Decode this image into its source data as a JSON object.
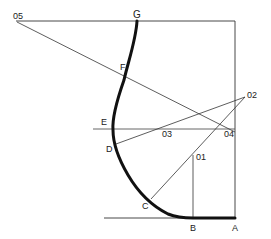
{
  "diagram": {
    "type": "geometric construction of curve",
    "labels": {
      "o5": "05",
      "G": "G",
      "F": "F",
      "E": "E",
      "D": "D",
      "C": "C",
      "B": "B",
      "A": "A",
      "o1": "01",
      "o2": "02",
      "o3": "03",
      "o4": "04"
    },
    "colors": {
      "line": "#333333",
      "curve": "#111111",
      "background": "#ffffff"
    }
  }
}
